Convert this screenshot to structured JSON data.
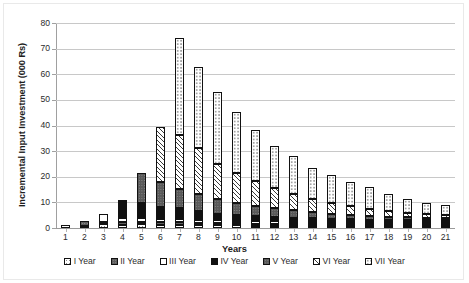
{
  "chart_data": {
    "type": "bar",
    "stacked": true,
    "title": "",
    "xlabel": "Years",
    "ylabel": "Incremental Input Investment (000 Rs)",
    "ylim": [
      0,
      80
    ],
    "ytick_values": [
      0,
      10,
      20,
      30,
      40,
      50,
      60,
      70,
      80
    ],
    "ytick_labels": [
      "0",
      "10",
      "20",
      "30",
      "40",
      "50",
      "60",
      "70",
      "80"
    ],
    "grid": true,
    "legend_position": "bottom",
    "categories": [
      "1",
      "2",
      "3",
      "4",
      "5",
      "6",
      "7",
      "8",
      "9",
      "10",
      "11",
      "12",
      "13",
      "14",
      "15",
      "16",
      "17",
      "18",
      "19",
      "20",
      "21"
    ],
    "series": [
      {
        "name": "I Year",
        "values": [
          1.0,
          0.6,
          1.6,
          1.3,
          1.4,
          1.3,
          1.3,
          1.2,
          1.1,
          1.0,
          0.9,
          0.9,
          0.8,
          0.7,
          0.6,
          0.5,
          0.5,
          0.4,
          0.4,
          0.3,
          0.3
        ]
      },
      {
        "name": "II Year",
        "values": [
          0.0,
          1.8,
          0.9,
          0.9,
          0.9,
          0.9,
          0.9,
          0.8,
          0.8,
          0.7,
          0.7,
          0.6,
          0.6,
          0.5,
          0.5,
          0.4,
          0.4,
          0.3,
          0.3,
          0.3,
          0.2
        ]
      },
      {
        "name": "III Year",
        "values": [
          0.0,
          0.0,
          3.1,
          1.6,
          1.6,
          1.4,
          1.3,
          1.2,
          1.1,
          1.0,
          1.0,
          0.9,
          0.8,
          0.7,
          0.6,
          0.5,
          0.5,
          0.4,
          0.4,
          0.3,
          0.3
        ]
      },
      {
        "name": "IV Year",
        "values": [
          0.0,
          0.0,
          0.0,
          7.3,
          5.8,
          4.8,
          4.2,
          3.3,
          2.6,
          2.3,
          2.0,
          1.8,
          1.6,
          1.4,
          1.2,
          1.0,
          0.9,
          0.8,
          0.7,
          0.6,
          0.5
        ]
      },
      {
        "name": "V Year",
        "values": [
          0.0,
          0.0,
          0.0,
          0.0,
          11.6,
          9.7,
          7.6,
          6.6,
          5.9,
          4.5,
          4.0,
          3.5,
          3.0,
          2.5,
          2.1,
          1.8,
          1.5,
          1.3,
          1.1,
          0.9,
          0.8
        ]
      },
      {
        "name": "VI Year",
        "values": [
          0.0,
          0.0,
          0.0,
          0.0,
          0.0,
          21.4,
          21.0,
          18.2,
          13.6,
          12.0,
          9.5,
          7.8,
          6.3,
          5.2,
          4.2,
          3.4,
          2.8,
          2.2,
          1.8,
          1.4,
          1.2
        ]
      },
      {
        "name": "VII Year",
        "values": [
          0.0,
          0.0,
          0.0,
          0.0,
          0.0,
          0.0,
          37.7,
          31.7,
          27.9,
          23.5,
          19.9,
          16.5,
          14.9,
          12.0,
          10.8,
          9.4,
          8.4,
          6.6,
          5.3,
          4.2,
          3.7
        ]
      }
    ],
    "totals": [
      1.0,
      2.4,
      5.6,
      11.1,
      21.3,
      39.5,
      74.0,
      63.0,
      53.0,
      45.0,
      38.0,
      32.0,
      28.0,
      23.0,
      20.0,
      17.0,
      15.0,
      12.0,
      10.0,
      8.0,
      7.0
    ],
    "annotations": []
  },
  "axis": {
    "y_title": "Incremental Input Investment (000 Rs)",
    "x_title": "Years"
  },
  "legend": {
    "items": [
      {
        "label": "I Year",
        "pattern": "dotted-light"
      },
      {
        "label": "II Year",
        "pattern": "grey-dotted"
      },
      {
        "label": "III Year",
        "pattern": "white"
      },
      {
        "label": "IV Year",
        "pattern": "solid-black"
      },
      {
        "label": "V Year",
        "pattern": "dark-grey"
      },
      {
        "label": "VI Year",
        "pattern": "diagonal-hatch"
      },
      {
        "label": "VII Year",
        "pattern": "dotted-white"
      }
    ]
  }
}
